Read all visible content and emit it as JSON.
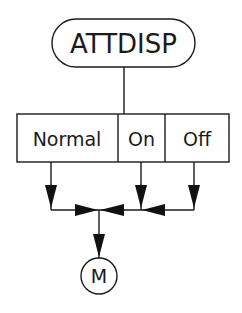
{
  "diagram": {
    "type": "flow-selector",
    "colors": {
      "ink": "#1a1a1a",
      "background": "#ffffff"
    },
    "title_node": {
      "label": "ATTDISP",
      "shape": "rounded-pill"
    },
    "options": [
      {
        "label": "Normal"
      },
      {
        "label": "On"
      },
      {
        "label": "Off"
      }
    ],
    "terminal_node": {
      "label": "M",
      "shape": "circle"
    },
    "edges": [
      {
        "from": "ATTDISP",
        "to": "options"
      },
      {
        "from": "Normal",
        "to": "merge"
      },
      {
        "from": "On",
        "to": "merge"
      },
      {
        "from": "Off",
        "to": "merge"
      },
      {
        "from": "merge",
        "to": "M"
      }
    ]
  }
}
